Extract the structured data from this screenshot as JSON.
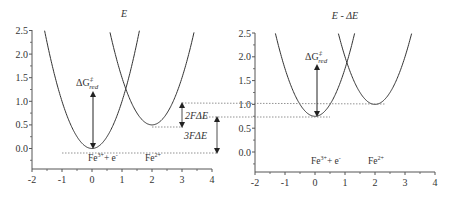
{
  "figure": {
    "colors": {
      "curve": "#333333",
      "axis": "#555555",
      "dotted": "#777777",
      "text": "#333333"
    }
  },
  "chart_data": [
    {
      "type": "line",
      "title": "E",
      "xlabel": "",
      "ylabel": "",
      "xlim": [
        -2,
        4
      ],
      "ylim": [
        -0.45,
        2.5
      ],
      "x_ticks": [
        "-2",
        "-1",
        "0",
        "1",
        "2",
        "3",
        "4"
      ],
      "y_ticks": [
        "0.0",
        "0.5",
        "1.0",
        "1.5",
        "2.0",
        "2.5"
      ],
      "grid": false,
      "series": [
        {
          "name": "Fe3+ + e- parabola",
          "center_x": 0,
          "min_y": 0.0,
          "curvature": 1.0
        },
        {
          "name": "Fe2+ parabola",
          "center_x": 2,
          "min_y": 0.5,
          "curvature": 1.0
        }
      ],
      "species_labels": [
        {
          "text_main": "Fe",
          "sup": "3+",
          "tail": "+ e",
          "tail_sup": "-",
          "x": 0
        },
        {
          "text_main": "Fe",
          "sup": "2+",
          "tail": "",
          "tail_sup": "",
          "x": 2
        }
      ],
      "annotations": {
        "activation": {
          "symbol": "ΔG",
          "sup": "‡",
          "sub": "red"
        },
        "two_f_delta_e": "2FΔE",
        "three_f_delta_e": "3FΔE"
      }
    },
    {
      "type": "line",
      "title": "E - ΔE",
      "xlabel": "",
      "ylabel": "",
      "xlim": [
        -2,
        4
      ],
      "ylim": [
        -0.45,
        2.5
      ],
      "x_ticks": [
        "-2",
        "-1",
        "0",
        "1",
        "2",
        "3",
        "4"
      ],
      "y_ticks": [
        "0.0",
        "0.5",
        "1.0",
        "1.5",
        "2.0",
        "2.5"
      ],
      "grid": false,
      "series": [
        {
          "name": "Fe3+ + e- parabola",
          "center_x": 0,
          "min_y": 0.75,
          "curvature": 1.0
        },
        {
          "name": "Fe2+ parabola",
          "center_x": 2,
          "min_y": 1.0,
          "curvature": 1.0
        }
      ],
      "species_labels": [
        {
          "text_main": "Fe",
          "sup": "3+",
          "tail": "+ e",
          "tail_sup": "-",
          "x": 0
        },
        {
          "text_main": "Fe",
          "sup": "2+",
          "tail": "",
          "tail_sup": "",
          "x": 2
        }
      ],
      "annotations": {
        "activation": {
          "symbol": "ΔG",
          "sup": "‡",
          "sub": "red"
        }
      }
    }
  ]
}
